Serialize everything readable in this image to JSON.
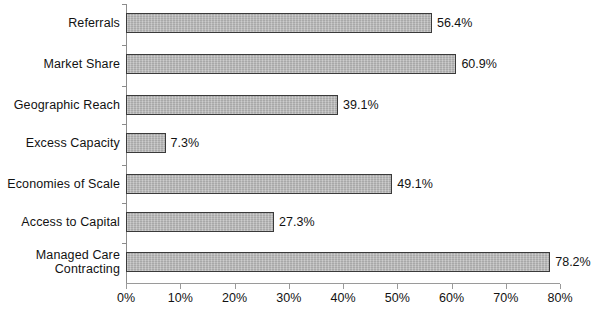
{
  "chart_data": {
    "type": "bar",
    "orientation": "horizontal",
    "title": "",
    "subtitle": "",
    "xlabel": "",
    "ylabel": "",
    "xlim": [
      0,
      80
    ],
    "grid": false,
    "legend": null,
    "xtick_labels": [
      "0%",
      "10%",
      "20%",
      "30%",
      "40%",
      "50%",
      "60%",
      "70%",
      "80%"
    ],
    "xtick_values": [
      0,
      10,
      20,
      30,
      40,
      50,
      60,
      70,
      80
    ],
    "categories": [
      "Referrals",
      "Market Share",
      "Geographic Reach",
      "Excess Capacity",
      "Economies of Scale",
      "Access to Capital",
      "Managed Care\nContracting"
    ],
    "values": [
      56.4,
      60.9,
      39.1,
      7.3,
      49.1,
      27.3,
      78.2
    ],
    "value_labels": [
      "56.4%",
      "60.9%",
      "39.1%",
      "7.3%",
      "49.1%",
      "27.3%",
      "78.2%"
    ],
    "bar_fill_color": "#b9b9b9",
    "bar_border_color": "#3a3a3a",
    "axis_color": "#8c8c8c",
    "text_color": "#121212",
    "background_color": "#ffffff"
  }
}
